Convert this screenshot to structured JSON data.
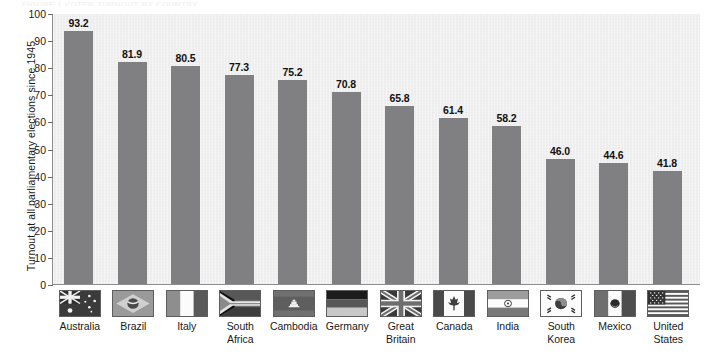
{
  "figure": {
    "caption": "FIGURE 1    VOTER TURNOUT BY COUNTRY"
  },
  "chart_data": {
    "type": "bar",
    "title": "",
    "xlabel": "",
    "ylabel": "Turnout at all parliamentary elections since 1945",
    "ylim": [
      0,
      100
    ],
    "ytick_step": 10,
    "yticks": [
      "100",
      "90",
      "80",
      "70",
      "60",
      "50",
      "40",
      "30",
      "20",
      "10",
      "0"
    ],
    "grid": false,
    "legend": "none",
    "bar_color": "#807f81",
    "plot_background": "#efefef",
    "categories": [
      "Australia",
      "Brazil",
      "Italy",
      "South Africa",
      "Cambodia",
      "Germany",
      "Great Britain",
      "Canada",
      "India",
      "South Korea",
      "Mexico",
      "United States"
    ],
    "values": [
      93.2,
      81.9,
      80.5,
      77.3,
      75.2,
      70.8,
      65.8,
      61.4,
      58.2,
      46.0,
      44.6,
      41.8
    ],
    "value_labels": [
      "93.2",
      "81.9",
      "80.5",
      "77.3",
      "75.2",
      "70.8",
      "65.8",
      "61.4",
      "58.2",
      "46.0",
      "44.6",
      "41.8"
    ],
    "category_label_lines": [
      [
        "Australia"
      ],
      [
        "Brazil"
      ],
      [
        "Italy"
      ],
      [
        "South",
        "Africa"
      ],
      [
        "Cambodia"
      ],
      [
        "Germany"
      ],
      [
        "Great",
        "Britain"
      ],
      [
        "Canada"
      ],
      [
        "India"
      ],
      [
        "South",
        "Korea"
      ],
      [
        "Mexico"
      ],
      [
        "United",
        "States"
      ]
    ],
    "flag_icons": [
      "flag-australia-icon",
      "flag-brazil-icon",
      "flag-italy-icon",
      "flag-south-africa-icon",
      "flag-cambodia-icon",
      "flag-germany-icon",
      "flag-great-britain-icon",
      "flag-canada-icon",
      "flag-india-icon",
      "flag-south-korea-icon",
      "flag-mexico-icon",
      "flag-united-states-icon"
    ]
  }
}
